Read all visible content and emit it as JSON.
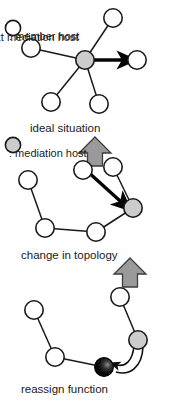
{
  "figure": {
    "orientation": "rotated-90-clockwise",
    "background_color": "#ffffff"
  },
  "panels": [
    {
      "id": "ideal-situation",
      "caption": "ideal situation",
      "topology": "star",
      "mediation_host": {
        "id": "m0",
        "x": 60,
        "y": 88
      },
      "member_hosts": [
        {
          "id": "a0",
          "x": 60,
          "y": 36
        },
        {
          "id": "a1",
          "x": 18,
          "y": 60
        },
        {
          "id": "a2",
          "x": 104,
          "y": 74
        },
        {
          "id": "a3",
          "x": 102,
          "y": 122
        },
        {
          "id": "a4",
          "x": 48,
          "y": 142
        }
      ],
      "edges": [
        [
          "m0",
          "a0"
        ],
        [
          "m0",
          "a1"
        ],
        [
          "m0",
          "a2"
        ],
        [
          "m0",
          "a3"
        ],
        [
          "m0",
          "a4"
        ]
      ],
      "thick_arrow": {
        "from": "m0",
        "to": "a0"
      }
    },
    {
      "id": "change-in-topology",
      "caption": "change in topology",
      "topology": "chain",
      "mediation_host": {
        "id": "m1",
        "x": 208,
        "y": 40
      },
      "member_hosts": [
        {
          "id": "b0",
          "x": 167,
          "y": 60
        },
        {
          "id": "b1",
          "x": 170,
          "y": 90
        },
        {
          "id": "b2",
          "x": 232,
          "y": 77
        },
        {
          "id": "b3",
          "x": 228,
          "y": 128
        },
        {
          "id": "b4",
          "x": 180,
          "y": 145
        }
      ],
      "edges": [
        [
          "m1",
          "b0"
        ],
        [
          "m1",
          "b2"
        ],
        [
          "b2",
          "b3"
        ],
        [
          "b3",
          "b4"
        ]
      ],
      "thick_arrow": {
        "from": "b1",
        "to": "m1"
      }
    },
    {
      "id": "reassign-function",
      "caption": "reassign function",
      "topology": "chain",
      "mediation_host": {
        "id": "m2",
        "x": 340,
        "y": 35
      },
      "next_mediation_host": {
        "id": "n2",
        "x": 367,
        "y": 69
      },
      "member_hosts": [
        {
          "id": "c0",
          "x": 297,
          "y": 53
        },
        {
          "id": "c1",
          "x": 357,
          "y": 118
        },
        {
          "id": "c2",
          "x": 310,
          "y": 139
        }
      ],
      "edges": [
        [
          "m2",
          "c0"
        ],
        [
          "n2",
          "c1"
        ],
        [
          "c1",
          "c2"
        ]
      ],
      "curved_arrow": {
        "from": "m2",
        "to": "n2",
        "style": "double-line-curve"
      }
    }
  ],
  "flow_arrows": [
    {
      "id": "flow-1",
      "from_panel": "ideal-situation",
      "to_panel": "change-in-topology",
      "direction": "right"
    },
    {
      "id": "flow-2",
      "from_panel": "change-in-topology",
      "to_panel": "reassign-function",
      "direction": "right"
    }
  ],
  "legend": {
    "items": [
      {
        "id": "member-host",
        "symbol": "open-circle",
        "label": ": member host",
        "fill": "#ffffff",
        "stroke": "#1a1a1a"
      },
      {
        "id": "mediation-host",
        "symbol": "gray-circle",
        "label": ": mediation host",
        "fill": "#cccccc",
        "stroke": "#1a1a1a"
      },
      {
        "id": "next-mediation-host",
        "symbol": "black-sphere",
        "label": ": next mediation host",
        "fill": "#0a0a0a",
        "stroke": "#0a0a0a"
      }
    ]
  },
  "colors": {
    "node_stroke": "#1a1a1a",
    "member_fill": "#ffffff",
    "mediation_fill": "#cccccc",
    "next_mediation_fill": "#0a0a0a",
    "block_arrow_fill": "#9a9a9a",
    "block_arrow_stroke": "#3d3d3d",
    "text": "#1a1a1a"
  }
}
